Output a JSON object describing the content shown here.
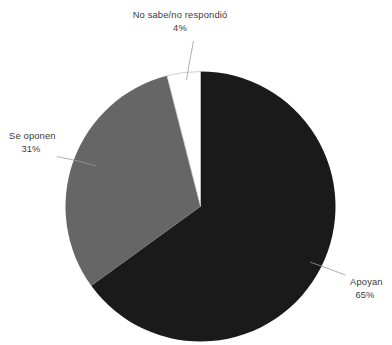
{
  "chart_data": {
    "type": "pie",
    "title": "",
    "subtitle": "",
    "xlabel": "",
    "ylabel": "",
    "legend_position": "none",
    "grid": false,
    "units": "percent",
    "start_angle_deg": 0,
    "direction": "clockwise",
    "categories": [
      "Apoyan",
      "Se oponen",
      "No sabe/no respondió"
    ],
    "values": [
      65,
      31,
      4
    ],
    "labels_display": [
      "65%",
      "31%",
      "4%"
    ],
    "colors": [
      "#1a1a1a",
      "#666666",
      "#ffffff"
    ],
    "slices": [
      {
        "name": "Apoyan",
        "value": 65,
        "value_label": "65%",
        "color": "#1a1a1a",
        "start_angle_deg": 0,
        "end_angle_deg": 234
      },
      {
        "name": "Se oponen",
        "value": 31,
        "value_label": "31%",
        "color": "#666666",
        "start_angle_deg": 234,
        "end_angle_deg": 345.6
      },
      {
        "name": "No sabe/no respondió",
        "value": 4,
        "value_label": "4%",
        "color": "#ffffff",
        "start_angle_deg": 345.6,
        "end_angle_deg": 360
      }
    ]
  },
  "labels": {
    "dontknow": {
      "name": "No sabe/no respondió",
      "percent": "4%"
    },
    "oppose": {
      "name": "Se oponen",
      "percent": "31%"
    },
    "support": {
      "name": "Apoyan",
      "percent": "65%"
    }
  },
  "colors": {
    "support_slice": "#1a1a1a",
    "oppose_slice": "#666666",
    "dontknow_slice": "#ffffff",
    "leader_line": "#9a9a9a",
    "label_text": "#3b3b3b",
    "background": "#ffffff"
  }
}
